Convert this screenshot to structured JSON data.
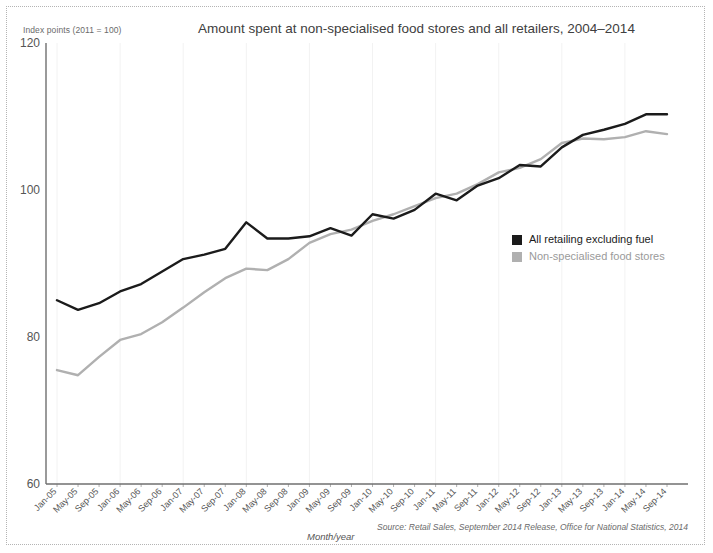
{
  "chart_data": {
    "type": "line",
    "title": "Amount spent at non-specialised food stores and all retailers, 2004–2014",
    "axis_caption": "Index points (2011 = 100)",
    "xlabel": "Month/year",
    "ylabel": "",
    "ylim": [
      60,
      120
    ],
    "yticks": [
      60,
      80,
      100,
      120
    ],
    "grid": "vertical-faint",
    "legend_position": "inside-right-middle",
    "source": "Source: Retail Sales, September 2014 Release, Office for National Statistics, 2014",
    "categories": [
      "Jan-05",
      "May-05",
      "Sep-05",
      "Jan-06",
      "May-06",
      "Sep-06",
      "Jan-07",
      "May-07",
      "Sep-07",
      "Jan-08",
      "May-08",
      "Sep-08",
      "Jan-09",
      "May-09",
      "Sep-09",
      "Jan-10",
      "May-10",
      "Sep-10",
      "Jan-11",
      "May-11",
      "Sep-11",
      "Jan-12",
      "May-12",
      "Sep-12",
      "Jan-13",
      "May-13",
      "Sep-13",
      "Jan-14",
      "May-14",
      "Sep-14"
    ],
    "series": [
      {
        "name": "All retailing excluding fuel",
        "color": "#1b1b1b",
        "values": [
          85.0,
          83.7,
          84.6,
          86.2,
          87.2,
          88.9,
          90.6,
          91.2,
          92.0,
          95.6,
          93.4,
          93.4,
          93.7,
          94.8,
          93.8,
          96.7,
          96.1,
          97.3,
          99.5,
          98.6,
          100.6,
          101.6,
          103.4,
          103.2,
          105.8,
          107.5,
          108.2,
          109.0,
          110.3,
          110.3
        ]
      },
      {
        "name": "Non-specialised food stores",
        "color": "#b0b0b0",
        "values": [
          75.5,
          74.8,
          77.3,
          79.6,
          80.4,
          82.0,
          84.0,
          86.1,
          88.0,
          89.3,
          89.1,
          90.6,
          92.8,
          94.0,
          94.6,
          95.8,
          96.7,
          97.8,
          98.9,
          99.5,
          100.8,
          102.4,
          103.0,
          104.2,
          106.4,
          107.0,
          106.9,
          107.2,
          108.0,
          107.6
        ]
      }
    ],
    "legend": [
      {
        "label": "All retailing excluding fuel",
        "color": "#1b1b1b"
      },
      {
        "label": "Non-specialised food stores",
        "color": "#b0b0b0"
      }
    ]
  }
}
